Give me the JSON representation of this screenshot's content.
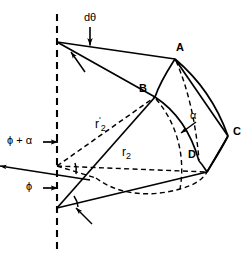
{
  "figure": {
    "type": "geometry-diagram",
    "background_color": "#ffffff",
    "stroke_color": "#000000"
  },
  "labels": {
    "d_theta": "dθ",
    "point_a": "A",
    "point_b": "B",
    "point_c": "C",
    "point_d": "D",
    "alpha": "α",
    "phi_plus_alpha": "ϕ + α",
    "phi": "ϕ",
    "r2_prime": "r'₂",
    "r2_prime_base": "r",
    "r2_prime_sup": "'",
    "r2_prime_sub": "2",
    "r2_base": "r",
    "r2_sub": "2"
  },
  "geometry": {
    "axis": {
      "x": 57,
      "y_top": 14,
      "y_bottom": 250,
      "dash": "7 5",
      "width": 2.0
    },
    "vertices": {
      "apex_top": [
        57,
        42
      ],
      "axis_mid": [
        57,
        166
      ],
      "apex_bottom": [
        57,
        208
      ],
      "A": [
        175,
        59
      ],
      "B": [
        155,
        97
      ],
      "C": [
        228,
        136
      ],
      "D": [
        199,
        161
      ],
      "E_lower_right": [
        207,
        172
      ]
    },
    "label_positions": {
      "d_theta": [
        86,
        16
      ],
      "A": [
        176,
        45
      ],
      "B": [
        140,
        88
      ],
      "C": [
        233,
        128
      ],
      "D": [
        189,
        152
      ],
      "alpha": [
        190,
        112
      ],
      "phi_plus_alpha": [
        8,
        136
      ],
      "phi": [
        26,
        182
      ],
      "r2_prime": [
        96,
        118
      ],
      "r2": [
        123,
        148
      ]
    }
  },
  "colors": {
    "ink": "#000000",
    "paper": "#ffffff"
  }
}
